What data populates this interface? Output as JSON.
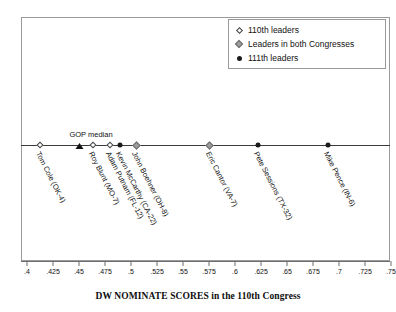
{
  "chart_data": {
    "type": "scatter",
    "title": "",
    "xlabel": "DW NOMINATE SCORES in the 110th Congress",
    "ylabel": "",
    "xlim": [
      0.4,
      0.75
    ],
    "xticks": [
      ".4",
      ".425",
      ".45",
      ".475",
      ".5",
      ".525",
      ".55",
      ".575",
      ".6",
      ".625",
      ".65",
      ".675",
      ".7",
      ".725",
      ".75"
    ],
    "xtick_values": [
      0.4,
      0.425,
      0.45,
      0.475,
      0.5,
      0.525,
      0.55,
      0.575,
      0.6,
      0.625,
      0.65,
      0.675,
      0.7,
      0.725,
      0.75
    ],
    "grid": false,
    "legend_position": "top-right",
    "annotations": [
      {
        "name": "gop-median",
        "label": "GOP median",
        "x": 0.45,
        "marker": "filled-triangle"
      }
    ],
    "points": [
      {
        "label": "Tom Cole (OK-4)",
        "x": 0.4125,
        "marker": "open-diamond",
        "series": "110th leaders"
      },
      {
        "label": "Roy Blunt (MO-7)",
        "x": 0.4635,
        "marker": "open-diamond",
        "series": "110th leaders"
      },
      {
        "label": "Adam Putnam (FL-12)",
        "x": 0.48,
        "marker": "open-diamond",
        "series": "110th leaders"
      },
      {
        "label": "Kevin McCarthy (CA-22)",
        "x": 0.4895,
        "marker": "filled-circle",
        "series": "111th leaders"
      },
      {
        "label": "John Boehner (OH-8)",
        "x": 0.505,
        "marker": "gray-diamond",
        "series": "Leaders in both Congresses"
      },
      {
        "label": "Eric Cantor (VA-7)",
        "x": 0.5755,
        "marker": "gray-diamond",
        "series": "Leaders in both Congresses"
      },
      {
        "label": "Pete Sessions (TX-32)",
        "x": 0.6225,
        "marker": "filled-circle",
        "series": "111th leaders"
      },
      {
        "label": "Mike Pence (IN-6)",
        "x": 0.6895,
        "marker": "filled-circle",
        "series": "111th leaders"
      }
    ],
    "legend": [
      {
        "label": "110th leaders",
        "marker": "open-diamond"
      },
      {
        "label": "Leaders in both Congresses",
        "marker": "gray-diamond"
      },
      {
        "label": "111th leaders",
        "marker": "filled-circle"
      }
    ]
  },
  "colors": {
    "frame": "#9a9a9a",
    "line": "#3a3a3a",
    "marker_fill_dark": "#1b1b1b",
    "marker_fill_gray": "#9b9b9b",
    "text": "#111111",
    "background": "#ffffff"
  }
}
